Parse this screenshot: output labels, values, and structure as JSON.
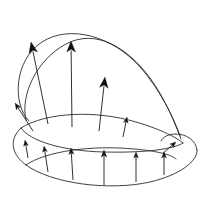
{
  "figure": {
    "width": 215,
    "height": 199,
    "background_color": "#ffffff",
    "stroke_color": "#2b2b2b",
    "arrow_color": "#111111"
  },
  "chart_data": {
    "type": "scatter",
    "xlabel": "",
    "ylabel": "",
    "xlim": [
      0,
      215
    ],
    "ylim": [
      0,
      199
    ],
    "grid": false,
    "legend": null,
    "curves": [
      {
        "name": "upper-outer-teardrop",
        "path": "M 29,121 C 12,104 14,60 42,42 C 70,24 113,36 141,68 C 160,90 174,118 180,136"
      },
      {
        "name": "upper-inner-teardrop",
        "path": "M 26,120 C 20,96 36,60 66,44 C 96,28 128,48 150,78 C 166,100 176,126 181,139"
      },
      {
        "name": "lens-top-edge",
        "path": "M 21,128 C 46,112 96,110 136,122 C 163,130 177,138 183,143"
      },
      {
        "name": "lens-bottom-edge",
        "path": "M 21,128 C 30,141 62,151 104,152 C 146,153 174,149 183,143"
      },
      {
        "name": "outer-shell-left",
        "path": "M 21,128 C 8,140 12,155 26,165"
      },
      {
        "name": "outer-lower-boundary",
        "path": "M 26,165 C 52,184 110,191 150,182 C 180,175 198,161 197,150"
      },
      {
        "name": "outer-shell-right",
        "path": "M 197,150 C 196,140 186,134 176,134 C 168,134 163,137 161,141"
      },
      {
        "name": "lower-surface-ridge",
        "path": "M 26,165 C 46,151 92,145 134,149 C 158,151 172,155 176,159"
      }
    ],
    "vectors": [
      {
        "id": "v-upper-1",
        "label": "upper normal 1",
        "x1": 48,
        "y1": 124,
        "x2": 31,
        "y2": 42,
        "head_angle_deg": -101
      },
      {
        "id": "v-upper-2",
        "label": "upper normal 2",
        "x1": 72,
        "y1": 127,
        "x2": 71,
        "y2": 41,
        "head_angle_deg": -90
      },
      {
        "id": "v-upper-3",
        "label": "upper normal 3",
        "x1": 99,
        "y1": 131,
        "x2": 105,
        "y2": 77,
        "head_angle_deg": -84
      },
      {
        "id": "v-upper-4",
        "label": "upper normal 4",
        "x1": 123,
        "y1": 137,
        "x2": 127,
        "y2": 117,
        "head_angle_deg": -79
      },
      {
        "id": "v-left-tip",
        "label": "left tip normal",
        "x1": 33,
        "y1": 131,
        "x2": 15,
        "y2": 103,
        "head_angle_deg": -123
      },
      {
        "id": "v-right-tip",
        "label": "right tip normal",
        "x1": 163,
        "y1": 153,
        "x2": 176,
        "y2": 142,
        "head_angle_deg": -40
      },
      {
        "id": "v-lower-1",
        "label": "lower normal 1",
        "x1": 28,
        "y1": 158,
        "x2": 25,
        "y2": 140,
        "head_angle_deg": -80
      },
      {
        "id": "v-lower-2",
        "label": "lower normal 2",
        "x1": 48,
        "y1": 172,
        "x2": 44,
        "y2": 146,
        "head_angle_deg": -81
      },
      {
        "id": "v-lower-3",
        "label": "lower normal 3",
        "x1": 73,
        "y1": 180,
        "x2": 71,
        "y2": 148,
        "head_angle_deg": -86
      },
      {
        "id": "v-lower-4",
        "label": "lower normal 4",
        "x1": 104,
        "y1": 185,
        "x2": 104,
        "y2": 150,
        "head_angle_deg": -90
      },
      {
        "id": "v-lower-5",
        "label": "lower normal 5",
        "x1": 136,
        "y1": 182,
        "x2": 136,
        "y2": 152,
        "head_angle_deg": -90
      },
      {
        "id": "v-lower-6",
        "label": "lower normal 6",
        "x1": 164,
        "y1": 175,
        "x2": 164,
        "y2": 152,
        "head_angle_deg": -90
      }
    ]
  }
}
